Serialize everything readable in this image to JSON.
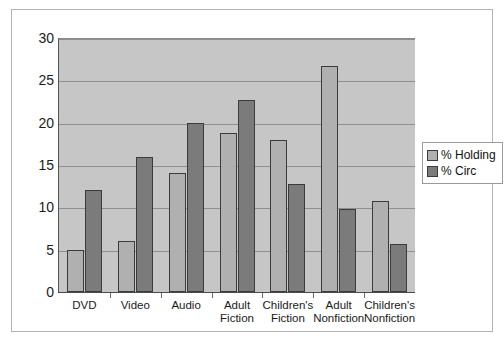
{
  "chart_data": {
    "type": "bar",
    "title": "",
    "xlabel": "",
    "ylabel": "",
    "ylim": [
      0,
      30
    ],
    "yticks": [
      "0",
      "5",
      "10",
      "15",
      "20",
      "25",
      "30"
    ],
    "grid": true,
    "legend_position": "right",
    "categories": [
      "DVD",
      "Video",
      "Audio",
      "Adult\nFiction",
      "Children's\nFiction",
      "Adult\nNonfiction",
      "Children's\nNonfiction"
    ],
    "series": [
      {
        "name": "% Holding",
        "color": "#b0b0b0",
        "values": [
          5.0,
          6.0,
          14.0,
          18.8,
          18.0,
          26.7,
          10.8
        ]
      },
      {
        "name": "% Circ",
        "color": "#7b7b7b",
        "values": [
          12.0,
          16.0,
          20.0,
          22.7,
          12.8,
          9.8,
          5.7
        ]
      }
    ]
  },
  "legend": {
    "items": [
      {
        "label": "% Holding",
        "swatch": "holding"
      },
      {
        "label": "% Circ",
        "swatch": "circ"
      }
    ]
  },
  "colors": {
    "plot_background": "#c6c6c6",
    "gridline": "#8f8f8f",
    "bar_holding": "#b0b0b0",
    "bar_circ": "#7b7b7b",
    "bar_outline": "#3b3b3b",
    "frame_border": "#b4b4b4",
    "page_background": "#ffffff"
  }
}
